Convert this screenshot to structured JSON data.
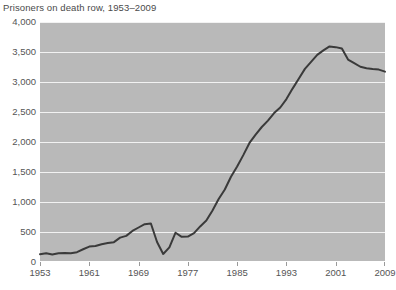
{
  "chart_data": {
    "type": "line",
    "title": "Prisoners on death row, 1953–2009",
    "xlabel": "",
    "ylabel": "",
    "xlim": [
      1953,
      2009
    ],
    "ylim": [
      0,
      4000
    ],
    "grid": true,
    "legend": "none",
    "x_ticks": [
      "1953",
      "1961",
      "1969",
      "1977",
      "1985",
      "1993",
      "2001",
      "2009"
    ],
    "x_tick_values": [
      1953,
      1961,
      1969,
      1977,
      1985,
      1993,
      2001,
      2009
    ],
    "y_ticks": [
      "0",
      "500",
      "1,000",
      "1,500",
      "2,000",
      "2,500",
      "3,000",
      "3,500",
      "4,000"
    ],
    "y_tick_values": [
      0,
      500,
      1000,
      1500,
      2000,
      2500,
      3000,
      3500,
      4000
    ],
    "series": [
      {
        "name": "Prisoners on death row",
        "x": [
          1953,
          1954,
          1955,
          1956,
          1957,
          1958,
          1959,
          1960,
          1961,
          1962,
          1963,
          1964,
          1965,
          1966,
          1967,
          1968,
          1969,
          1970,
          1971,
          1972,
          1973,
          1974,
          1975,
          1976,
          1977,
          1978,
          1979,
          1980,
          1981,
          1982,
          1983,
          1984,
          1985,
          1986,
          1987,
          1988,
          1989,
          1990,
          1991,
          1992,
          1993,
          1994,
          1995,
          1996,
          1997,
          1998,
          1999,
          2000,
          2001,
          2002,
          2003,
          2004,
          2005,
          2006,
          2007,
          2008,
          2009
        ],
        "values": [
          131,
          147,
          125,
          146,
          151,
          147,
          164,
          212,
          257,
          267,
          297,
          315,
          331,
          406,
          435,
          517,
          575,
          631,
          642,
          334,
          134,
          244,
          488,
          420,
          423,
          482,
          593,
          691,
          860,
          1050,
          1209,
          1420,
          1591,
          1781,
          1984,
          2124,
          2250,
          2356,
          2482,
          2575,
          2716,
          2890,
          3054,
          3219,
          3335,
          3452,
          3527,
          3593,
          3581,
          3557,
          3374,
          3315,
          3254,
          3228,
          3215,
          3207,
          3173
        ]
      }
    ],
    "annotations": [],
    "colors": {
      "line": "#3a3a3a",
      "plot_background": "#b9b9b9",
      "gridline": "#f2f2f2",
      "page_background": "#ffffff",
      "text": "#555555",
      "title_text": "#4a4a4a"
    }
  }
}
